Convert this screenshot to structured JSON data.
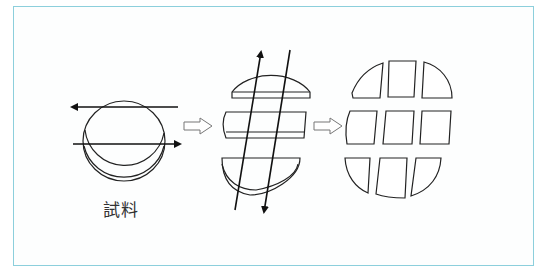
{
  "figure": {
    "border_color": "#8ccfdc",
    "sample_label": "試料",
    "steps": [
      {
        "name": "sample-disc",
        "cuts": "two horizontal cuts (arrows left and right)"
      },
      {
        "name": "three-strips",
        "cuts": "two diagonal cuts (arrows up and down)"
      },
      {
        "name": "nine-pieces",
        "cuts": "none"
      }
    ],
    "arrows": [
      "process-arrow-1",
      "process-arrow-2"
    ]
  }
}
